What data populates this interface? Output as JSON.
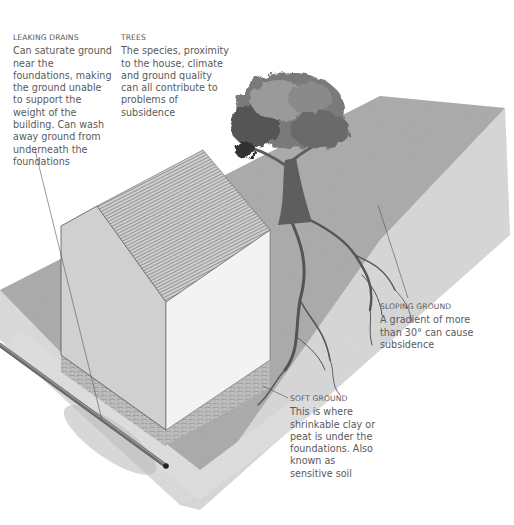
{
  "annotations": [
    {
      "id": "leaking-drains",
      "title": "LEAKING DRAINS",
      "body": "Can saturate ground near the foundations, making the ground unable to support the weight of the building. Can wash away ground from underneath the foundations"
    },
    {
      "id": "trees",
      "title": "TREES",
      "body": "The species, proximity to the house, climate and ground quality can all contribute to problems of subsidence"
    },
    {
      "id": "sloping-ground",
      "title": "SLOPING GROUND",
      "body": "A gradient of more than 30° can cause subsidence"
    },
    {
      "id": "soft-ground",
      "title": "SOFT GROUND",
      "body": "This is where shrinkable clay or peat is under the foundations. Also known as sensitive soil"
    }
  ],
  "colors": {
    "text": "#5a5a5a",
    "ground_dark": "#a9a9a9",
    "ground_light": "#dcdcdc",
    "wall_front": "#cfcfcf",
    "wall_side": "#f2f2f2",
    "roof": "#bdbdbd",
    "brick": "#9a9a9a",
    "tree_foliage": "#6e6e6e",
    "trunk": "#5e5e5e",
    "leader_line": "#555555"
  }
}
